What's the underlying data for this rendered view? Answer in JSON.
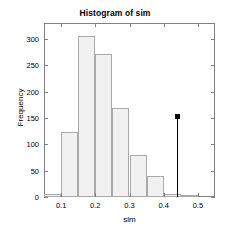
{
  "chart_data": {
    "type": "bar",
    "title": "Histogram of sim",
    "xlabel": "sim",
    "ylabel": "Frequency",
    "xlim": [
      0.05,
      0.55
    ],
    "ylim": [
      0,
      330
    ],
    "grid": false,
    "legend": null,
    "bin_width": 0.05,
    "bin_edges": [
      0.05,
      0.1,
      0.15,
      0.2,
      0.25,
      0.3,
      0.35,
      0.4,
      0.45,
      0.5,
      0.55
    ],
    "categories": [
      "0.05-0.10",
      "0.10-0.15",
      "0.15-0.20",
      "0.20-0.25",
      "0.25-0.30",
      "0.30-0.35",
      "0.35-0.40",
      "0.40-0.45",
      "0.45-0.50",
      "0.50-0.55"
    ],
    "values": [
      5,
      124,
      306,
      272,
      169,
      79,
      40,
      5,
      3,
      0
    ],
    "x_ticks": [
      0.1,
      0.2,
      0.3,
      0.4,
      0.5
    ],
    "x_tick_labels": [
      "0.1",
      "0.2",
      "0.3",
      "0.4",
      "0.5"
    ],
    "y_ticks": [
      0,
      50,
      100,
      150,
      200,
      250,
      300
    ],
    "y_tick_labels": [
      "0",
      "50",
      "100",
      "150",
      "200",
      "250",
      "300"
    ],
    "bar_fill_color": "#f1f1f1",
    "bar_edge_color": "#a9a9a9",
    "axis_color": "#808080",
    "annotations": [
      {
        "type": "stem",
        "name": "observed-value-marker",
        "x": 0.44,
        "y": 154,
        "marker": "filled-square",
        "color": "#000000"
      }
    ]
  }
}
